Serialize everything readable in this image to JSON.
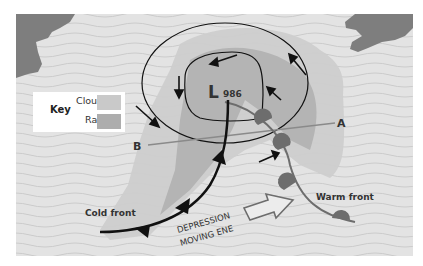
{
  "map": {
    "low_symbol": "L",
    "pressure": "986",
    "point_a": "A",
    "point_b": "B",
    "cold_front_label": "Cold front",
    "warm_front_label": "Warm front",
    "movement_line1": "DEPRESSION",
    "movement_line2": "MOVING ENE"
  },
  "key": {
    "title": "Key",
    "items": [
      {
        "label": "Cloud",
        "color": "#c9c9c9"
      },
      {
        "label": "Rain",
        "color": "#adadad"
      }
    ]
  },
  "colors": {
    "sea": "#e2e2e2",
    "wave": "#cfcfcf",
    "land": "#7d7d7d",
    "cloud": "#cdcdcd",
    "rain": "#b3b3b3",
    "front": "#111111",
    "warm_front": "#6d6d6d",
    "section_line": "#8a8a8a"
  }
}
